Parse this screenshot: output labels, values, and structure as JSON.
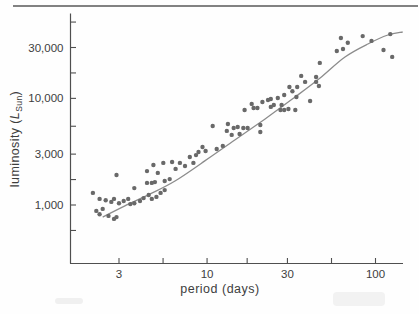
{
  "chart_data": {
    "type": "scatter",
    "title": "",
    "xlabel": "period (days)",
    "ylabel": "luminosity (L_Sun)",
    "ylabel_parts": {
      "prefix": "luminosity (",
      "symbol": "L",
      "subscript": "Sun",
      "suffix": ")"
    },
    "x_scale": "log",
    "y_scale": "log",
    "xlim": [
      1.5,
      145
    ],
    "ylim": [
      283,
      62500
    ],
    "grid": false,
    "legend": false,
    "x_ticks": [
      {
        "value": 3,
        "label": "3"
      },
      {
        "value": 5.48,
        "label": ""
      },
      {
        "value": 10,
        "label": "10"
      },
      {
        "value": 17.3,
        "label": ""
      },
      {
        "value": 30,
        "label": "30"
      },
      {
        "value": 54.8,
        "label": ""
      },
      {
        "value": 100,
        "label": "100"
      }
    ],
    "y_ticks": [
      {
        "value": 577,
        "label": ""
      },
      {
        "value": 1000,
        "label": "1,000"
      },
      {
        "value": 1732,
        "label": ""
      },
      {
        "value": 3000,
        "label": "3,000"
      },
      {
        "value": 5477,
        "label": ""
      },
      {
        "value": 10000,
        "label": "10,000"
      },
      {
        "value": 17320,
        "label": ""
      },
      {
        "value": 30000,
        "label": "30,000"
      },
      {
        "value": 51960,
        "label": ""
      }
    ],
    "points": [
      [
        2.1,
        1300
      ],
      [
        2.3,
        1140
      ],
      [
        2.2,
        880
      ],
      [
        2.4,
        920
      ],
      [
        2.3,
        820
      ],
      [
        2.5,
        1110
      ],
      [
        2.6,
        790
      ],
      [
        2.7,
        1070
      ],
      [
        2.8,
        740
      ],
      [
        2.9,
        770
      ],
      [
        2.8,
        1140
      ],
      [
        2.9,
        1910
      ],
      [
        3.0,
        1040
      ],
      [
        3.2,
        1090
      ],
      [
        3.4,
        1140
      ],
      [
        3.5,
        1020
      ],
      [
        3.7,
        1040
      ],
      [
        3.7,
        1440
      ],
      [
        4.0,
        1090
      ],
      [
        4.2,
        1160
      ],
      [
        4.5,
        1240
      ],
      [
        4.7,
        1140
      ],
      [
        5.0,
        1190
      ],
      [
        5.3,
        1300
      ],
      [
        5.6,
        1380
      ],
      [
        4.4,
        1610
      ],
      [
        4.7,
        1610
      ],
      [
        4.9,
        1640
      ],
      [
        5.6,
        1680
      ],
      [
        6.0,
        1750
      ],
      [
        4.4,
        2080
      ],
      [
        4.8,
        2370
      ],
      [
        5.1,
        2000
      ],
      [
        5.5,
        2480
      ],
      [
        6.2,
        2530
      ],
      [
        6.5,
        2180
      ],
      [
        6.9,
        2480
      ],
      [
        7.4,
        2320
      ],
      [
        7.9,
        2820
      ],
      [
        8.3,
        2480
      ],
      [
        8.6,
        2940
      ],
      [
        8.9,
        3140
      ],
      [
        9.4,
        3500
      ],
      [
        9.8,
        3210
      ],
      [
        10.8,
        5510
      ],
      [
        11.4,
        3350
      ],
      [
        12.4,
        3580
      ],
      [
        13.1,
        4950
      ],
      [
        13.3,
        5750
      ],
      [
        14.0,
        4540
      ],
      [
        14.4,
        5270
      ],
      [
        15.2,
        5390
      ],
      [
        15.6,
        4630
      ],
      [
        16.4,
        5270
      ],
      [
        16.7,
        7780
      ],
      [
        17.4,
        5270
      ],
      [
        18.9,
        8130
      ],
      [
        20.7,
        5630
      ],
      [
        20.7,
        4840
      ],
      [
        18.4,
        8870
      ],
      [
        19.9,
        8130
      ],
      [
        21.3,
        9250
      ],
      [
        23.0,
        9650
      ],
      [
        23.9,
        8310
      ],
      [
        23.9,
        9860
      ],
      [
        24.9,
        8670
      ],
      [
        26.3,
        10080
      ],
      [
        27.3,
        7780
      ],
      [
        27.7,
        8670
      ],
      [
        28.7,
        10760
      ],
      [
        28.7,
        7780
      ],
      [
        30.4,
        7950
      ],
      [
        30.8,
        12790
      ],
      [
        32.1,
        11660
      ],
      [
        33.4,
        7780
      ],
      [
        33.9,
        10300
      ],
      [
        34.3,
        12790
      ],
      [
        36.2,
        16230
      ],
      [
        38.2,
        14270
      ],
      [
        40.9,
        9450
      ],
      [
        44.4,
        15880
      ],
      [
        44.4,
        14270
      ],
      [
        46.1,
        13070
      ],
      [
        46.7,
        21490
      ],
      [
        58.9,
        27810
      ],
      [
        62.3,
        36850
      ],
      [
        64.1,
        29030
      ],
      [
        68.5,
        33170
      ],
      [
        84,
        38370
      ],
      [
        94.7,
        34610
      ],
      [
        111.5,
        28410
      ],
      [
        122.4,
        40050
      ],
      [
        125.6,
        24470
      ]
    ],
    "trend_curve": [
      [
        2.4,
        770
      ],
      [
        3.25,
        980
      ],
      [
        4.6,
        1270
      ],
      [
        6.45,
        1680
      ],
      [
        9.7,
        2590
      ],
      [
        14.6,
        4070
      ],
      [
        22.1,
        6410
      ],
      [
        33.3,
        10300
      ],
      [
        46.9,
        15540
      ],
      [
        65.9,
        24460
      ],
      [
        90.1,
        32390
      ],
      [
        118.5,
        39330
      ],
      [
        145,
        41960
      ]
    ],
    "colors": {
      "point": "#696969",
      "curve": "#8c8c8c",
      "axis": "#4f4f4f",
      "text": "#3d3d3d",
      "rule": "#828282"
    }
  }
}
